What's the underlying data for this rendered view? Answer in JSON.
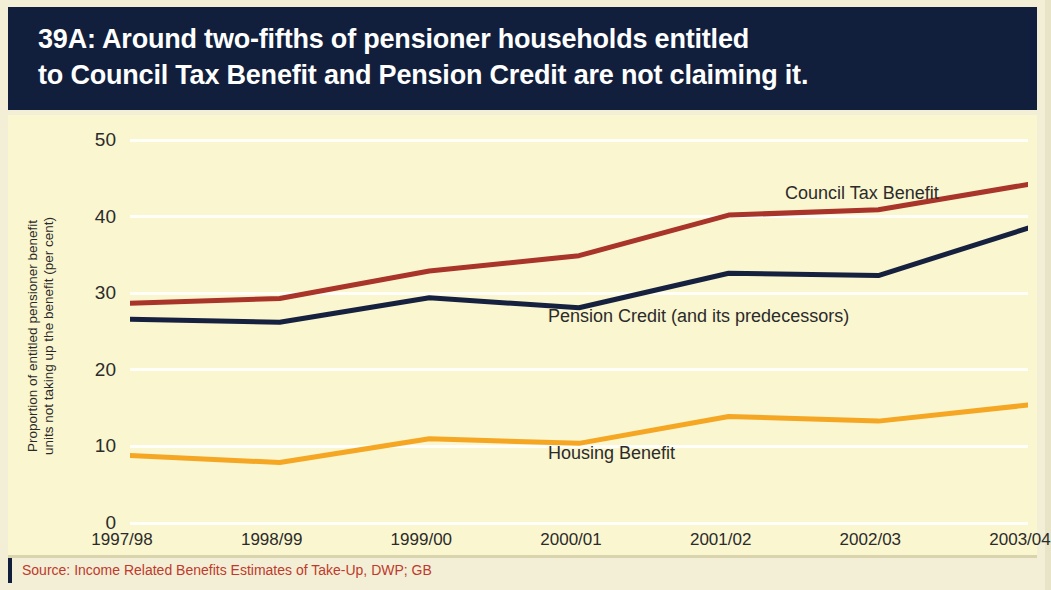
{
  "header": {
    "line1": "39A: Around two-fifths of pensioner households entitled",
    "line2": "to Council Tax Benefit and Pension Credit are not claiming it.",
    "background": "#111f3d",
    "text_color": "#ffffff"
  },
  "source": {
    "text": "Source: Income Related Benefits Estimates of Take-Up, DWP; GB",
    "color": "#c0392b"
  },
  "labels": {
    "council_tax_benefit": "Council Tax Benefit",
    "pension_credit": "Pension Credit (and its predecessors)",
    "housing_benefit": "Housing Benefit"
  },
  "chart_data": {
    "type": "line",
    "title": "39A: Around two-fifths of pensioner households entitled to Council Tax Benefit and Pension Credit are not claiming it.",
    "xlabel": "",
    "ylabel": "Proportion of entitled pensioner benefit units not taking up the benefit (per cent)",
    "ylabel_line1": "Proportion of entitled pensioner benefit",
    "ylabel_line2": "units not taking up the benefit (per cent)",
    "categories": [
      "1997/98",
      "1998/99",
      "1999/00",
      "2000/01",
      "2001/02",
      "2002/03",
      "2003/04"
    ],
    "ylim": [
      0,
      50
    ],
    "yticks": [
      0,
      10,
      20,
      30,
      40,
      50
    ],
    "grid": true,
    "legend_position": "inline-labels",
    "background": "#faf6cf",
    "series": [
      {
        "name": "Council Tax Benefit",
        "color": "#a8342a",
        "values": [
          28.7,
          29.3,
          32.9,
          34.9,
          40.2,
          40.9,
          44.2
        ]
      },
      {
        "name": "Pension Credit (and its predecessors)",
        "color": "#15213f",
        "values": [
          26.6,
          26.2,
          29.4,
          28.1,
          32.6,
          32.3,
          38.5
        ]
      },
      {
        "name": "Housing Benefit",
        "color": "#f5a623",
        "values": [
          8.8,
          7.9,
          11.0,
          10.4,
          13.9,
          13.3,
          15.4
        ]
      }
    ]
  }
}
